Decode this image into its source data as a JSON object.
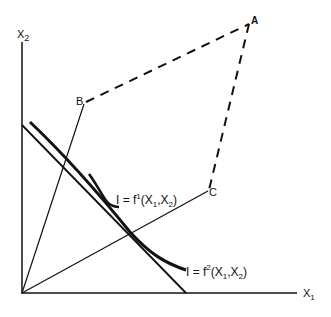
{
  "diagram": {
    "axes": {
      "x_label": "X",
      "x_sub": "1",
      "y_label": "X",
      "y_sub": "2"
    },
    "points": {
      "A": "A",
      "B": "B",
      "C": "C"
    },
    "curves": {
      "f1": {
        "lhs": "I = f",
        "sup": "1",
        "args_open": "(X",
        "args_sub1": "1",
        "args_mid": ",X",
        "args_sub2": "2",
        "args_close": ")"
      },
      "f2": {
        "lhs": "I = f",
        "sup": "2",
        "args_open": "(X",
        "args_sub1": "1",
        "args_mid": ",X",
        "args_sub2": "2",
        "args_close": ")"
      }
    },
    "colors": {
      "ink": "#111111",
      "background": "#ffffff"
    }
  }
}
